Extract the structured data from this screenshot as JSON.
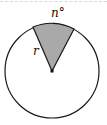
{
  "diagram": {
    "type": "circle-sector",
    "labels": {
      "angle": "n°",
      "radius": "r"
    },
    "colors": {
      "sector_fill": "#a9a9a9",
      "stroke": "#1a1a1a",
      "background": "#ffffff"
    }
  }
}
